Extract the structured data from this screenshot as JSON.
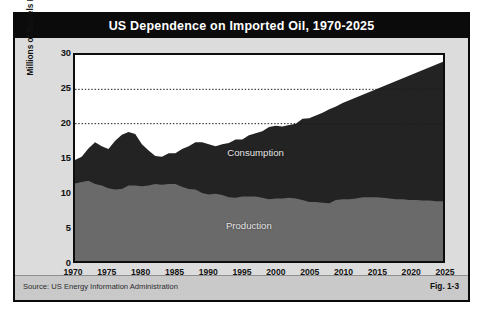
{
  "figure": {
    "title": "US Dependence on Imported Oil,  1970-2025",
    "source": "Source:  US Energy Information Administration",
    "fig_number": "Fig. 1-3",
    "colors": {
      "frame": "#0a0a0a",
      "title_bar": "#0b0b0b",
      "title_text": "#ffffff",
      "body_background": "#dcdcdc",
      "footer_background": "#c9c9c9",
      "plot_background": "#ffffff",
      "consumption_fill": "#232323",
      "production_fill": "#6a6a6a",
      "gridline": "#1a1a1a",
      "series_label_text": "#e6e6e6"
    }
  },
  "chart_data": {
    "type": "area",
    "stacked": true,
    "title": "US Dependence on Imported Oil,  1970-2025",
    "xlabel": "",
    "ylabel": "Millions of Barrels Per Day",
    "xlim": [
      1970,
      2025
    ],
    "ylim": [
      0,
      30
    ],
    "yticks": [
      0,
      5,
      10,
      15,
      20,
      25,
      30
    ],
    "ytick_labels": [
      "0",
      "5",
      "10",
      "15",
      "20",
      "25",
      "30"
    ],
    "xticks": [
      1970,
      1975,
      1980,
      1985,
      1990,
      1995,
      2000,
      2005,
      2010,
      2015,
      2020,
      2025
    ],
    "xtick_labels": [
      "1970",
      "1975",
      "1980",
      "1985",
      "1990",
      "1995",
      "2000",
      "2005",
      "2010",
      "2015",
      "2020",
      "2025"
    ],
    "gridlines": {
      "y": [
        20,
        25
      ],
      "style": "dotted",
      "x": []
    },
    "legend": "inline-labels",
    "annotations": [
      {
        "text": "Consumption",
        "x": 1997,
        "y": 15.9
      },
      {
        "text": "Production",
        "x": 1996,
        "y": 5.4
      }
    ],
    "x": [
      1970,
      1971,
      1972,
      1973,
      1974,
      1975,
      1976,
      1977,
      1978,
      1979,
      1980,
      1981,
      1982,
      1983,
      1984,
      1985,
      1986,
      1987,
      1988,
      1989,
      1990,
      1991,
      1992,
      1993,
      1994,
      1995,
      1996,
      1997,
      1998,
      1999,
      2000,
      2001,
      2002,
      2003,
      2004,
      2005,
      2006,
      2007,
      2008,
      2009,
      2010,
      2011,
      2012,
      2013,
      2014,
      2015,
      2016,
      2017,
      2018,
      2019,
      2020,
      2021,
      2022,
      2023,
      2024,
      2025
    ],
    "series": [
      {
        "name": "Production",
        "values": [
          11.3,
          11.5,
          11.7,
          11.2,
          11.0,
          10.6,
          10.4,
          10.5,
          11.0,
          11.0,
          10.9,
          11.0,
          11.2,
          11.1,
          11.2,
          11.2,
          10.8,
          10.5,
          10.4,
          9.9,
          9.7,
          9.8,
          9.6,
          9.3,
          9.2,
          9.4,
          9.4,
          9.4,
          9.2,
          9.0,
          9.1,
          9.1,
          9.2,
          9.1,
          8.9,
          8.6,
          8.6,
          8.5,
          8.4,
          8.9,
          9.0,
          9.0,
          9.1,
          9.3,
          9.3,
          9.3,
          9.2,
          9.1,
          9.0,
          9.0,
          8.9,
          8.9,
          8.8,
          8.8,
          8.7,
          8.7
        ]
      },
      {
        "name": "Consumption",
        "values": [
          14.7,
          15.2,
          16.4,
          17.3,
          16.7,
          16.3,
          17.5,
          18.4,
          18.8,
          18.5,
          17.0,
          16.1,
          15.3,
          15.2,
          15.7,
          15.7,
          16.3,
          16.7,
          17.3,
          17.3,
          17.0,
          16.7,
          17.0,
          17.2,
          17.7,
          17.7,
          18.3,
          18.6,
          18.9,
          19.5,
          19.7,
          19.6,
          19.8,
          20.0,
          20.7,
          20.8,
          21.2,
          21.6,
          22.1,
          22.5,
          23.0,
          23.4,
          23.8,
          24.2,
          24.6,
          25.0,
          25.4,
          25.8,
          26.2,
          26.6,
          27.0,
          27.4,
          27.8,
          28.2,
          28.6,
          29.0
        ]
      }
    ]
  },
  "labels": {
    "consumption": "Consumption",
    "production": "Production"
  }
}
